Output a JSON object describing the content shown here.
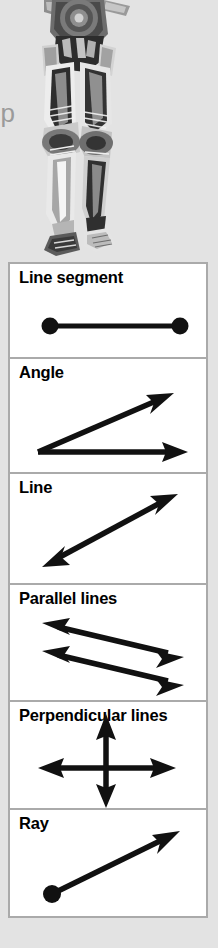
{
  "page": {
    "background_color": "#e3e3e3",
    "clipped_text": "up"
  },
  "illustration": {
    "name": "battle-droid-figure",
    "description": "Grayscale mechanical droid figure, lower torso and legs",
    "palette": {
      "dark": "#2b2b2b",
      "mid": "#6f6f6f",
      "light": "#c9c9c9",
      "highlight": "#efefef"
    }
  },
  "table": {
    "border_color": "#aaaaaa",
    "cell_background": "#ffffff",
    "stroke_color": "#111111",
    "rows": [
      {
        "label": "Line segment",
        "figure": "line-segment-diagram"
      },
      {
        "label": "Angle",
        "figure": "angle-diagram"
      },
      {
        "label": "Line",
        "figure": "line-diagram"
      },
      {
        "label": "Parallel lines",
        "figure": "parallel-lines-diagram"
      },
      {
        "label": "Perpendicular lines",
        "figure": "perpendicular-lines-diagram"
      },
      {
        "label": "Ray",
        "figure": "ray-diagram"
      }
    ]
  }
}
